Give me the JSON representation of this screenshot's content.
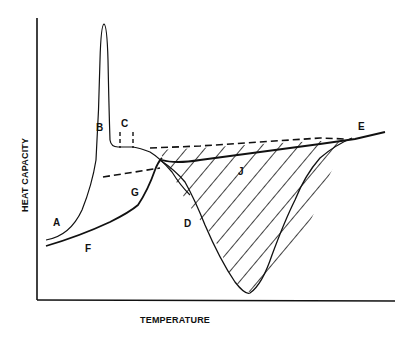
{
  "diagram": {
    "type": "heat-capacity-vs-temperature",
    "xlabel": "TEMPERATURE",
    "ylabel": "HEAT CAPACITY",
    "curve_labels": {
      "A": "A",
      "B": "B",
      "C": "C",
      "D": "D",
      "E": "E",
      "F": "F",
      "G": "G",
      "J": "J"
    },
    "colors": {
      "line": "#111111",
      "background": "#ffffff"
    }
  }
}
